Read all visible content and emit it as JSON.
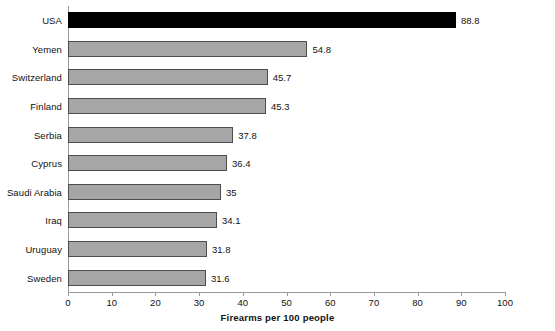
{
  "chart_data": {
    "type": "bar",
    "orientation": "horizontal",
    "title": "",
    "xlabel": "Firearms per 100 people",
    "ylabel": "",
    "xlim": [
      0,
      100
    ],
    "xticks": [
      0,
      10,
      20,
      30,
      40,
      50,
      60,
      70,
      80,
      90,
      100
    ],
    "xtick_labels": [
      "0",
      "10",
      "20",
      "30",
      "40",
      "50",
      "60",
      "70",
      "80",
      "90",
      "100"
    ],
    "grid": false,
    "legend": "none",
    "categories": [
      "USA",
      "Yemen",
      "Switzerland",
      "Finland",
      "Serbia",
      "Cyprus",
      "Saudi Arabia",
      "Iraq",
      "Uruguay",
      "Sweden"
    ],
    "values": [
      88.8,
      54.8,
      45.7,
      45.3,
      37.8,
      36.4,
      35,
      34.1,
      31.8,
      31.6
    ],
    "value_labels": [
      "88.8",
      "54.8",
      "45.7",
      "45.3",
      "37.8",
      "36.4",
      "35",
      "34.1",
      "31.8",
      "31.6"
    ],
    "bar_colors": [
      "#000000",
      "#a6a6a6",
      "#a6a6a6",
      "#a6a6a6",
      "#a6a6a6",
      "#a6a6a6",
      "#a6a6a6",
      "#a6a6a6",
      "#a6a6a6",
      "#a6a6a6"
    ],
    "highlight_category": "USA",
    "colors": {
      "highlight": "#000000",
      "bar_fill": "#a6a6a6",
      "bar_edge": "#4d4d4d",
      "axis": "#9a9a9a",
      "text": "#111111",
      "background": "#ffffff"
    }
  }
}
